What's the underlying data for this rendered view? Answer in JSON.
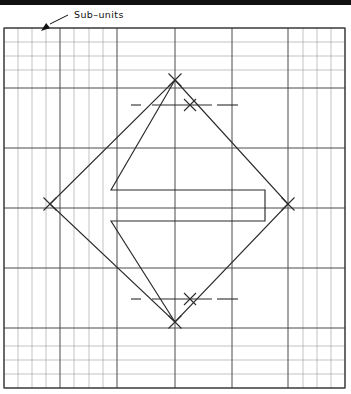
{
  "figure": {
    "annotations": [
      {
        "id": "sub-units",
        "label": "Sub–units",
        "label_x": 74,
        "label_y": 18,
        "leader": {
          "x1": 68,
          "y1": 15,
          "x2": 50,
          "y2": 24
        },
        "arrow_tip": {
          "x": 41,
          "y": 31
        }
      }
    ],
    "page_edge_bar": {
      "x": 0,
      "y": 0,
      "width": 351,
      "height": 5,
      "color": "#111111"
    },
    "frame": {
      "x": 4,
      "y": 28,
      "width": 341,
      "height": 360,
      "color": "#3b3b3b",
      "stroke_width": 1.1
    },
    "grid": {
      "major_color": "#4a4a4a",
      "minor_color": "#9a9a9a",
      "major_width": 1.0,
      "minor_width": 0.6,
      "unit_label": "Sub–units",
      "major_x": [
        4,
        60,
        117,
        175,
        232,
        288,
        345
      ],
      "major_y": [
        28,
        88,
        148,
        208,
        268,
        328,
        388
      ],
      "minor_x": [
        18,
        32,
        46,
        74,
        89,
        103,
        303,
        317,
        331
      ],
      "minor_y": [
        42,
        56,
        70,
        346,
        360,
        374
      ],
      "light_full_x": [],
      "light_full_y": [
        42,
        56,
        70,
        346,
        360,
        374
      ]
    },
    "diamond": {
      "name": "rotated-square",
      "color": "#2b2b2b",
      "stroke_width": 1.15,
      "vertices": {
        "top": {
          "x": 175,
          "y": 80
        },
        "right": {
          "x": 288,
          "y": 204
        },
        "bottom": {
          "x": 175,
          "y": 322
        },
        "left": {
          "x": 50,
          "y": 204
        }
      }
    },
    "inner_shape": {
      "name": "zigzag-bracket",
      "color": "#2b2b2b",
      "stroke_width": 1.15,
      "points": [
        {
          "x": 175,
          "y": 80
        },
        {
          "x": 111,
          "y": 190
        },
        {
          "x": 265,
          "y": 190
        },
        {
          "x": 265,
          "y": 221
        },
        {
          "x": 111,
          "y": 221
        },
        {
          "x": 175,
          "y": 322
        }
      ]
    },
    "construction_marks": {
      "color": "#2b2b2b",
      "stroke_width": 1.1,
      "crosses": [
        {
          "name": "top-vertex-cross",
          "x": 175,
          "y": 80,
          "size": 13
        },
        {
          "name": "left-vertex-cross",
          "x": 50,
          "y": 204,
          "size": 13
        },
        {
          "name": "right-vertex-cross",
          "x": 288,
          "y": 204,
          "size": 13
        },
        {
          "name": "bottom-vertex-cross",
          "x": 175,
          "y": 322,
          "size": 13
        },
        {
          "name": "upper-chord-cross",
          "x": 190,
          "y": 105,
          "size": 12
        },
        {
          "name": "lower-chord-cross",
          "x": 190,
          "y": 299,
          "size": 12
        }
      ],
      "tick_lines": [
        {
          "name": "upper-chord-line",
          "x1": 152,
          "y1": 105,
          "x2": 212,
          "y2": 105
        },
        {
          "name": "upper-chord-extension",
          "x1": 217,
          "y1": 105,
          "x2": 238,
          "y2": 105
        },
        {
          "name": "upper-left-dash",
          "x1": 131,
          "y1": 105,
          "x2": 141,
          "y2": 105
        },
        {
          "name": "lower-chord-line",
          "x1": 152,
          "y1": 299,
          "x2": 212,
          "y2": 299
        },
        {
          "name": "lower-chord-extension",
          "x1": 217,
          "y1": 299,
          "x2": 238,
          "y2": 299
        },
        {
          "name": "lower-left-dash",
          "x1": 131,
          "y1": 299,
          "x2": 141,
          "y2": 299
        }
      ]
    }
  }
}
